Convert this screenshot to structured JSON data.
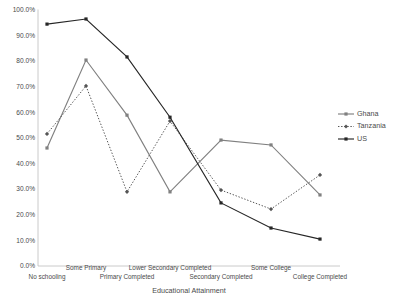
{
  "chart_data": {
    "type": "line",
    "title": "",
    "xlabel": "Educational Attainment",
    "ylabel": "",
    "ylim": [
      0,
      1.0
    ],
    "grid": false,
    "legend_position": "right",
    "categories": [
      "No schooling",
      "Some Primary",
      "Primary Completed",
      "Lower Secondary Completed",
      "Secondary Completed",
      "Some College",
      "College Completed"
    ],
    "ytick_labels": [
      "0.0%",
      "10.0%",
      "20.0%",
      "30.0%",
      "40.0%",
      "50.0%",
      "60.0%",
      "70.0%",
      "80.0%",
      "90.0%",
      "100.0%"
    ],
    "ytick_values": [
      0,
      10,
      20,
      30,
      40,
      50,
      60,
      70,
      80,
      90,
      100
    ],
    "series": [
      {
        "name": "Ghana",
        "color": "#808080",
        "marker": "square",
        "dash": "none",
        "values": [
          46.0,
          80.3,
          58.8,
          28.9,
          49.1,
          47.2,
          27.7
        ]
      },
      {
        "name": "Tanzania",
        "color": "#555555",
        "marker": "diamond",
        "dash": "dotted",
        "values": [
          51.5,
          70.2,
          28.9,
          56.5,
          29.6,
          22.2,
          35.5
        ]
      },
      {
        "name": "US",
        "color": "#262626",
        "marker": "square",
        "dash": "none",
        "values": [
          94.3,
          96.3,
          81.5,
          58.0,
          24.6,
          14.8,
          10.5
        ]
      }
    ]
  },
  "legend": {
    "entries": [
      "Ghana",
      "Tanzania",
      "US"
    ]
  }
}
